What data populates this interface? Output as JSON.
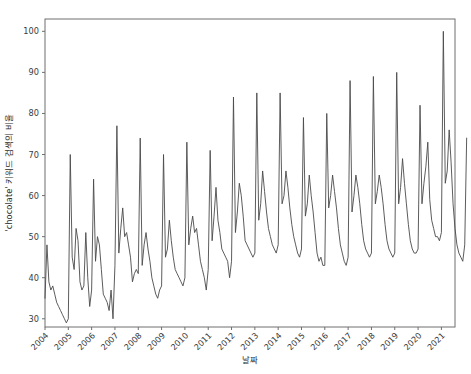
{
  "figure": {
    "width": 471,
    "height": 374,
    "background": "#ffffff",
    "line_color": "#4a4a4a",
    "axis_color": "#6e6e6e",
    "text_color": "#3a3a3a"
  },
  "axes": {
    "x_title": "날짜",
    "y_title": "'chocolate' 키워드 검색의 비율",
    "x_tick_labels": [
      "2004",
      "2005",
      "2006",
      "2007",
      "2008",
      "2009",
      "2010",
      "2011",
      "2012",
      "2013",
      "2014",
      "2015",
      "2016",
      "2017",
      "2018",
      "2019",
      "2020",
      "2021"
    ],
    "y_tick_labels": [
      "30",
      "40",
      "50",
      "60",
      "70",
      "80",
      "90",
      "100"
    ],
    "x_tick_rotation_deg": 45,
    "plot_left_px": 45,
    "plot_right_px": 455,
    "plot_top_px": 19,
    "plot_bottom_px": 327
  },
  "chart_data": {
    "type": "line",
    "title": "",
    "xlabel": "날짜",
    "ylabel": "'chocolate' 키워드 검색의 비율",
    "xlim": [
      "2004-01",
      "2021-08"
    ],
    "ylim": [
      28,
      103
    ],
    "yticks": [
      30,
      40,
      50,
      60,
      70,
      80,
      90,
      100
    ],
    "xticks": [
      "2004-01",
      "2005-01",
      "2006-01",
      "2007-01",
      "2008-01",
      "2009-01",
      "2010-01",
      "2011-01",
      "2012-01",
      "2013-01",
      "2014-01",
      "2015-01",
      "2016-01",
      "2017-01",
      "2018-01",
      "2019-01",
      "2020-01",
      "2021-01"
    ],
    "grid": false,
    "legend": false,
    "x_frequency": "monthly",
    "x_start": "2004-01",
    "series": [
      {
        "name": "'chocolate' search interest",
        "color": "#4a4a4a",
        "values": [
          35,
          48,
          39,
          37,
          38,
          36,
          34,
          33,
          32,
          31,
          30,
          29,
          30,
          70,
          45,
          42,
          52,
          49,
          39,
          37,
          38,
          51,
          40,
          33,
          37,
          64,
          44,
          50,
          48,
          42,
          36,
          35,
          34,
          32,
          37,
          30,
          43,
          77,
          46,
          52,
          57,
          50,
          51,
          48,
          45,
          39,
          41,
          42,
          41,
          74,
          43,
          48,
          51,
          47,
          44,
          40,
          38,
          36,
          35,
          37,
          38,
          70,
          45,
          47,
          54,
          49,
          45,
          42,
          41,
          40,
          39,
          38,
          40,
          73,
          48,
          52,
          55,
          51,
          52,
          48,
          44,
          42,
          40,
          37,
          42,
          71,
          49,
          55,
          62,
          54,
          51,
          47,
          46,
          45,
          44,
          40,
          44,
          84,
          51,
          56,
          63,
          60,
          55,
          49,
          48,
          47,
          46,
          45,
          46,
          85,
          54,
          58,
          66,
          61,
          56,
          52,
          50,
          48,
          47,
          46,
          48,
          85,
          58,
          60,
          66,
          62,
          57,
          53,
          50,
          48,
          46,
          45,
          47,
          79,
          55,
          58,
          65,
          60,
          56,
          51,
          46,
          44,
          45,
          43,
          43,
          80,
          57,
          60,
          65,
          61,
          57,
          52,
          48,
          46,
          44,
          43,
          45,
          88,
          56,
          60,
          65,
          62,
          58,
          53,
          49,
          47,
          46,
          45,
          46,
          89,
          58,
          61,
          65,
          62,
          58,
          53,
          49,
          47,
          46,
          45,
          46,
          90,
          58,
          62,
          69,
          63,
          58,
          53,
          49,
          47,
          46,
          46,
          47,
          82,
          58,
          63,
          67,
          73,
          59,
          54,
          52,
          50,
          50,
          49,
          51,
          100,
          63,
          66,
          76,
          68,
          58,
          52,
          48,
          46,
          45,
          44,
          48,
          74
        ]
      }
    ]
  }
}
